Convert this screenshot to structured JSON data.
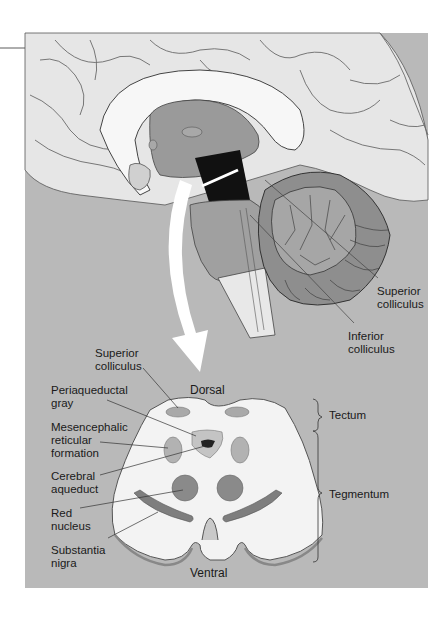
{
  "figure": {
    "type": "anatomical-diagram",
    "colors": {
      "panel_background": "#b9b9b9",
      "brain_surface": "#e8e8e8",
      "cross_section_fill": "#f2f2f2",
      "nuclei_fill": "#8a8a8a",
      "light_nuclei_fill": "#a9a9a9",
      "arrow": "#ffffff"
    }
  },
  "upper_view": {
    "description": "Sagittal view of brain with midbrain highlighted",
    "labels": {
      "superior_colliculus": [
        "Superior",
        "colliculus"
      ],
      "inferior_colliculus": [
        "Inferior",
        "colliculus"
      ]
    }
  },
  "cross_section": {
    "orientation": {
      "dorsal": "Dorsal",
      "ventral": "Ventral"
    },
    "left_labels": {
      "superior_colliculus": [
        "Superior",
        "colliculus"
      ],
      "periaqueductal_gray": [
        "Periaqueductal",
        "gray"
      ],
      "mesencephalic_reticular_formation": [
        "Mesencephalic",
        "reticular",
        "formation"
      ],
      "cerebral_aqueduct": [
        "Cerebral",
        "aqueduct"
      ],
      "red_nucleus": [
        "Red",
        "nucleus"
      ],
      "substantia_nigra": [
        "Substantia",
        "nigra"
      ]
    },
    "brackets": {
      "tectum": "Tectum",
      "tegmentum": "Tegmentum"
    }
  }
}
